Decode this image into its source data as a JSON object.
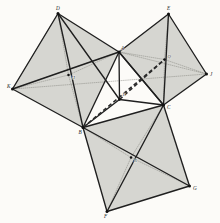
{
  "figure": {
    "background_color": "#fcfbf8",
    "stroke_color": "#1f1f1f",
    "fill_color": "#c9c9c4",
    "fill_opacity": 0.75,
    "dotted_color": "#7a7a74",
    "dashed_color": "#2b2b2b"
  },
  "points": {
    "A": {
      "x": 119.0,
      "y": 52.0,
      "label": "A",
      "lx": 121.0,
      "ly": 49.5
    },
    "B": {
      "x": 83.0,
      "y": 127.5,
      "label": "B",
      "lx": 78.5,
      "ly": 133.5
    },
    "C": {
      "x": 163.5,
      "y": 105.0,
      "label": "C",
      "lx": 167.0,
      "ly": 108.5
    },
    "D": {
      "x": 58.0,
      "y": 13.5,
      "label": "D",
      "lx": 56.0,
      "ly": 10.0
    },
    "E": {
      "x": 168.5,
      "y": 14.0,
      "label": "E",
      "lx": 167.0,
      "ly": 10.0
    },
    "F": {
      "x": 107.0,
      "y": 211.5,
      "label": "F",
      "lx": 104.0,
      "ly": 217.5
    },
    "G": {
      "x": 189.5,
      "y": 186.0,
      "label": "G",
      "lx": 193.0,
      "ly": 189.5
    },
    "K": {
      "x": 12.5,
      "y": 89.0,
      "label": "K",
      "lx": 7.0,
      "ly": 88.0
    },
    "J": {
      "x": 206.5,
      "y": 74.0,
      "label": "J",
      "lx": 210.0,
      "ly": 75.5
    },
    "P": {
      "x": 119.5,
      "y": 99.5,
      "label": "P",
      "lx": 122.5,
      "ly": 96.0
    },
    "H": {
      "x": 68.5,
      "y": 75.0,
      "label": "H",
      "lx": 71.5,
      "ly": 78.5
    },
    "Q": {
      "x": 164.5,
      "y": 59.5,
      "label": "Q",
      "lx": 167.5,
      "ly": 57.5
    },
    "R": {
      "x": 131.0,
      "y": 157.5,
      "label": "R",
      "lx": 134.0,
      "ly": 161.5
    }
  },
  "squares": [
    {
      "name": "square-on-AB",
      "vertices": [
        "A",
        "D",
        "K",
        "B"
      ],
      "center": "H"
    },
    {
      "name": "square-on-AC",
      "vertices": [
        "A",
        "E",
        "J",
        "C"
      ],
      "center": "Q"
    },
    {
      "name": "square-on-BC",
      "vertices": [
        "B",
        "C",
        "G",
        "F"
      ],
      "center": "R"
    }
  ],
  "solid_segments": [
    [
      "A",
      "B"
    ],
    [
      "B",
      "C"
    ],
    [
      "C",
      "A"
    ],
    [
      "A",
      "D"
    ],
    [
      "D",
      "K"
    ],
    [
      "K",
      "B"
    ],
    [
      "A",
      "E"
    ],
    [
      "E",
      "J"
    ],
    [
      "J",
      "C"
    ],
    [
      "B",
      "F"
    ],
    [
      "F",
      "G"
    ],
    [
      "G",
      "C"
    ],
    [
      "A",
      "P"
    ],
    [
      "B",
      "P"
    ],
    [
      "C",
      "P"
    ],
    [
      "D",
      "B"
    ],
    [
      "K",
      "A"
    ],
    [
      "E",
      "C"
    ],
    [
      "B",
      "G"
    ],
    [
      "C",
      "F"
    ],
    [
      "A",
      "C"
    ],
    [
      "D",
      "P"
    ]
  ],
  "dotted_segments": [
    [
      "D",
      "K"
    ],
    [
      "A",
      "J"
    ],
    [
      "K",
      "A"
    ],
    [
      "H",
      "D"
    ],
    [
      "H",
      "A"
    ],
    [
      "H",
      "K"
    ],
    [
      "H",
      "B"
    ],
    [
      "Q",
      "A"
    ],
    [
      "Q",
      "E"
    ],
    [
      "Q",
      "J"
    ],
    [
      "Q",
      "C"
    ],
    [
      "R",
      "B"
    ],
    [
      "R",
      "C"
    ],
    [
      "R",
      "G"
    ],
    [
      "R",
      "F"
    ],
    [
      "K",
      "J"
    ]
  ],
  "dashed_segments": [
    [
      "B",
      "Q"
    ],
    [
      "P",
      "Q"
    ]
  ],
  "labels": {
    "vertices": [
      "A",
      "B",
      "C",
      "D",
      "E",
      "F",
      "G",
      "J",
      "K"
    ],
    "centers": [
      "H",
      "Q",
      "R"
    ],
    "intersection": [
      "P"
    ]
  }
}
